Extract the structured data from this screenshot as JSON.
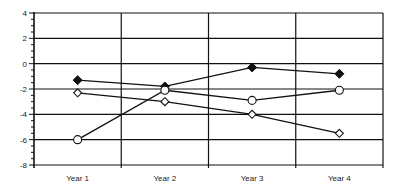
{
  "chart_data": {
    "type": "line",
    "title": "",
    "xlabel": "",
    "ylabel": "",
    "categories": [
      "Year 1",
      "Year 2",
      "Year 3",
      "Year 4"
    ],
    "ylim": [
      -8,
      4
    ],
    "yticks": [
      4,
      2,
      0,
      -2,
      -4,
      -6,
      -8
    ],
    "ytick_labels": [
      "4",
      "2",
      "0",
      "-2",
      "-4",
      "-6",
      "-8"
    ],
    "minor_ticks_per_major": 4,
    "grid": true,
    "legend": null,
    "series": [
      {
        "name": "Series A",
        "marker": "filled-diamond",
        "values": [
          -1.3,
          -1.8,
          -0.3,
          -0.8
        ]
      },
      {
        "name": "Series B",
        "marker": "open-diamond",
        "values": [
          -2.3,
          -3.0,
          -4.0,
          -5.5
        ]
      },
      {
        "name": "Series C",
        "marker": "open-circle",
        "values": [
          -6.0,
          -2.1,
          -2.9,
          -2.1
        ]
      }
    ],
    "colors": {
      "line": "#111111",
      "grid": "#111111",
      "background": "#ffffff"
    }
  }
}
